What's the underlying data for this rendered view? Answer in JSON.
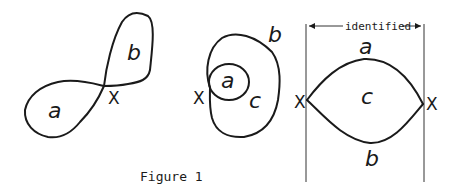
{
  "figure": {
    "caption": "Figure 1",
    "panel1": {
      "labels": {
        "a": "a",
        "b": "b",
        "x": "X"
      }
    },
    "panel2": {
      "labels": {
        "a": "a",
        "b": "b",
        "c": "c",
        "x": "X"
      }
    },
    "panel3": {
      "labels": {
        "a": "a",
        "b": "b",
        "c": "c",
        "x_left": "X",
        "x_right": "X"
      },
      "identified_label": "identified"
    }
  }
}
